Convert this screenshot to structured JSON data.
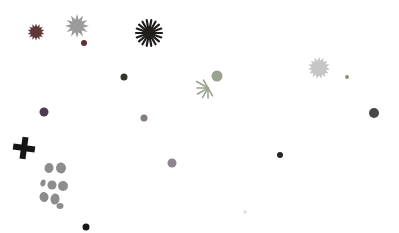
{
  "canvas": {
    "width": 399,
    "height": 233,
    "background": "#ffffff"
  },
  "shapes": [
    {
      "name": "maroon-gear-burst",
      "type": "burst",
      "cx": 36,
      "cy": 32,
      "outer": 8.5,
      "inner": 5.5,
      "points": 14,
      "color": "#5e3936"
    },
    {
      "name": "silver-star-burst",
      "type": "burst",
      "cx": 77,
      "cy": 26,
      "outer": 12,
      "inner": 6.5,
      "points": 12,
      "color": "#9b9b9b"
    },
    {
      "name": "maroon-dot",
      "type": "dot",
      "cx": 84,
      "cy": 43,
      "r": 3,
      "color": "#5a3332"
    },
    {
      "name": "black-ray-flower",
      "type": "rays",
      "cx": 149,
      "cy": 33,
      "r": 13,
      "count": 18,
      "stroke": 2.2,
      "core": 3.5,
      "color": "#221d1d"
    },
    {
      "name": "charcoal-dot",
      "type": "dot",
      "cx": 124,
      "cy": 77,
      "r": 3.5,
      "color": "#37342f"
    },
    {
      "name": "green-spider-asterisk",
      "type": "spider",
      "cx": 208,
      "cy": 88,
      "stroke": 1.6,
      "color": "#9aa38f",
      "legs": [
        {
          "angle": 150,
          "len": 13
        },
        {
          "angle": 180,
          "len": 11
        },
        {
          "angle": 210,
          "len": 12
        },
        {
          "angle": 240,
          "len": 11
        },
        {
          "angle": 270,
          "len": 10
        },
        {
          "angle": 300,
          "len": 9
        },
        {
          "angle": 120,
          "len": 9
        }
      ],
      "head": {
        "dx": 9,
        "dy": -12,
        "r": 5.5
      }
    },
    {
      "name": "light-gray-gear-burst",
      "type": "burst",
      "cx": 319,
      "cy": 68,
      "outer": 11,
      "inner": 7.5,
      "points": 15,
      "color": "#c6c6c6"
    },
    {
      "name": "olive-speck",
      "type": "dot",
      "cx": 347,
      "cy": 77,
      "r": 2,
      "color": "#8e9077"
    },
    {
      "name": "plum-dot",
      "type": "dot",
      "cx": 44,
      "cy": 112,
      "r": 4.5,
      "color": "#4e3d4e"
    },
    {
      "name": "dark-gray-dot",
      "type": "dot",
      "cx": 374,
      "cy": 113,
      "r": 5,
      "color": "#4a4646"
    },
    {
      "name": "mauve-dot-small",
      "type": "dot",
      "cx": 144,
      "cy": 118,
      "r": 3.5,
      "color": "#857b85"
    },
    {
      "name": "mauve-dot",
      "type": "dot",
      "cx": 172,
      "cy": 163,
      "r": 4.5,
      "color": "#8f8691"
    },
    {
      "name": "black-plus",
      "type": "plus",
      "cx": 24,
      "cy": 148,
      "arm": 11,
      "thick": 6,
      "rotate": 8,
      "color": "#161616"
    },
    {
      "name": "gray-blob-cluster",
      "type": "blobs",
      "color": "#8d8d8d",
      "items": [
        {
          "cx": 49,
          "cy": 168,
          "rx": 4.5,
          "ry": 5,
          "rot": 10
        },
        {
          "cx": 61,
          "cy": 168,
          "rx": 5,
          "ry": 5.5,
          "rot": -8
        },
        {
          "cx": 43,
          "cy": 183,
          "rx": 2.5,
          "ry": 3.5,
          "rot": 15
        },
        {
          "cx": 52,
          "cy": 185,
          "rx": 4.5,
          "ry": 4.5,
          "rot": 0
        },
        {
          "cx": 63,
          "cy": 186,
          "rx": 5,
          "ry": 5,
          "rot": 0
        },
        {
          "cx": 44,
          "cy": 197,
          "rx": 4.5,
          "ry": 5,
          "rot": -12
        },
        {
          "cx": 55,
          "cy": 199,
          "rx": 4.5,
          "ry": 5.5,
          "rot": 8
        },
        {
          "cx": 60,
          "cy": 206,
          "rx": 3.5,
          "ry": 3,
          "rot": 0
        }
      ]
    },
    {
      "name": "black-dot-right",
      "type": "dot",
      "cx": 280,
      "cy": 155,
      "r": 3,
      "color": "#242424"
    },
    {
      "name": "black-dot-bottom",
      "type": "dot",
      "cx": 86,
      "cy": 227,
      "r": 3.5,
      "color": "#191919"
    },
    {
      "name": "faint-speck",
      "type": "dot",
      "cx": 245,
      "cy": 212,
      "r": 2,
      "color": "#e4e4e4"
    }
  ]
}
